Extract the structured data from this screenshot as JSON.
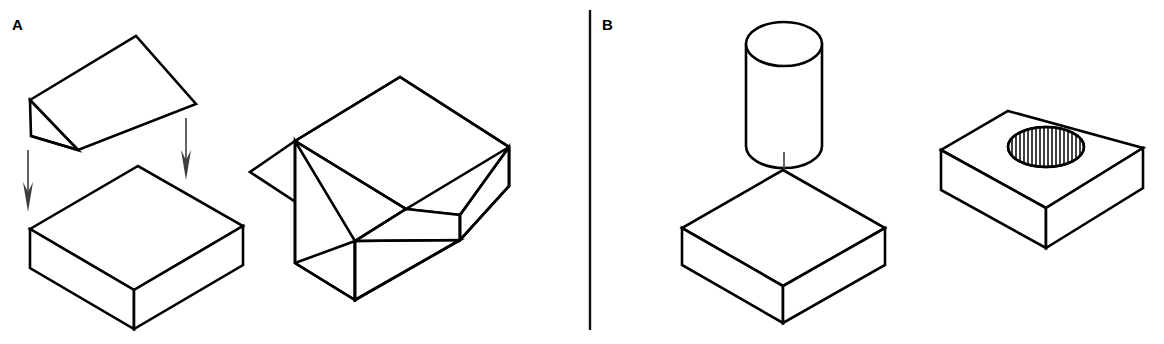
{
  "figure": {
    "background_color": "#ffffff",
    "line_color": "#000000",
    "arrow_color": "#3d3d3d",
    "width": 1164,
    "height": 344
  },
  "panels": [
    {
      "id": "A",
      "label": "A",
      "label_x": 12,
      "label_y": 30,
      "operation": "boolean-subtraction-wedge",
      "description": "Triangular wedge subtracted from rectangular slab yields slab with angled notch"
    },
    {
      "id": "B",
      "label": "B",
      "label_x": 602,
      "label_y": 30,
      "operation": "boolean-subtraction-cylinder",
      "description": "Cylinder subtracted from rectangular slab yields slab with circular through hole"
    }
  ],
  "divider": {
    "x": 590,
    "y_top": 10,
    "y_bottom": 330
  },
  "shapes": {
    "panel_a_wedge": {
      "name": "triangular-wedge-tool",
      "top_face": "30,100 136,36 196,104 78,150",
      "left_face": "30,100 31,136 78,150",
      "front_edge": "31,136 78,150"
    },
    "panel_a_slab": {
      "name": "rectangular-slab-target",
      "top_face": "30,229 138,166 243,226 134,290",
      "left_face": "30,229 30,268 134,329 134,290",
      "right_face": "134,290 134,329 243,265 243,226"
    },
    "panel_a_result": {
      "name": "notched-block-result",
      "back_top_face": "295,141 400,77 509,147 406,209",
      "slope_face": "295,141 406,209 355,241 250,172",
      "left_face_upper": "295,141 295,178 355,241",
      "seat_face": "355,241 406,209 509,147 509,186 460,215 407,247",
      "left_face_lower": "295,178 295,263 355,300 355,241",
      "front_face": "355,241 355,300 460,240 460,215",
      "bottom_front": "355,300 460,240",
      "right_face": "460,215 460,240 509,186 509,147"
    },
    "panel_b_cylinder": {
      "name": "cylinder-tool",
      "center_x": 784,
      "top_y": 44,
      "bottom_y": 146,
      "rx": 38,
      "ry": 22
    },
    "panel_b_slab": {
      "name": "rectangular-slab-target",
      "top_face": "783,170 885,228 783,286 682,228",
      "left_face": "682,228 682,265 783,323 783,286",
      "right_face": "783,286 783,323 885,265 885,228"
    },
    "panel_b_result": {
      "name": "block-with-hole-result",
      "top_face": "1008,111 1143,148 1046,208 941,150",
      "left_face": "941,150 941,190 1046,248 1046,208",
      "right_face": "1046,208 1046,248 1143,188 1143,148",
      "hole": {
        "center_x": 1046,
        "center_y": 147,
        "rx": 38,
        "ry": 20,
        "hatch_count": 19
      }
    }
  },
  "arrows": [
    {
      "name": "wedge-drop-arrow-left",
      "x": 28,
      "y_start": 150,
      "y_end": 212
    },
    {
      "name": "wedge-drop-arrow-right",
      "x": 186,
      "y_start": 118,
      "y_end": 180
    },
    {
      "name": "cylinder-drop-arrow",
      "x": 784,
      "y_start": 152,
      "y_end": 206
    }
  ]
}
